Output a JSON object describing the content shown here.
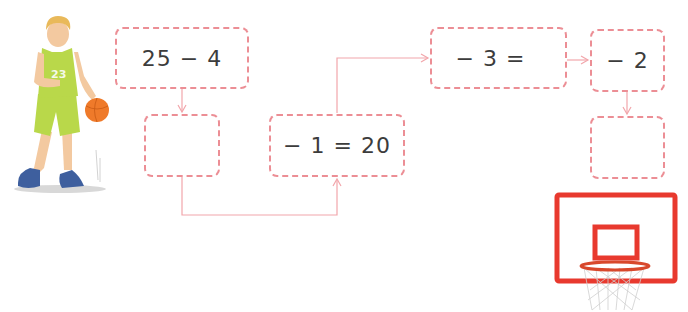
{
  "puzzle": {
    "boxes": [
      {
        "id": "start",
        "text": "25 − 4"
      },
      {
        "id": "result-1",
        "text": ""
      },
      {
        "id": "step-2",
        "text": "− 1 = 20"
      },
      {
        "id": "step-3",
        "text": "− 3 ="
      },
      {
        "id": "step-4",
        "text": "− 2"
      },
      {
        "id": "final",
        "text": ""
      }
    ]
  },
  "illustrations": {
    "player": {
      "label": "basketball player",
      "jersey_number": "23"
    },
    "hoop": {
      "label": "basketball hoop"
    }
  },
  "colors": {
    "box_border": "#ec8e95",
    "connector": "#f2a6ab",
    "hoop_red": "#e8392e",
    "text": "#3c3c3c",
    "jersey": "#b9d84a",
    "ball": "#ef7a2a"
  }
}
